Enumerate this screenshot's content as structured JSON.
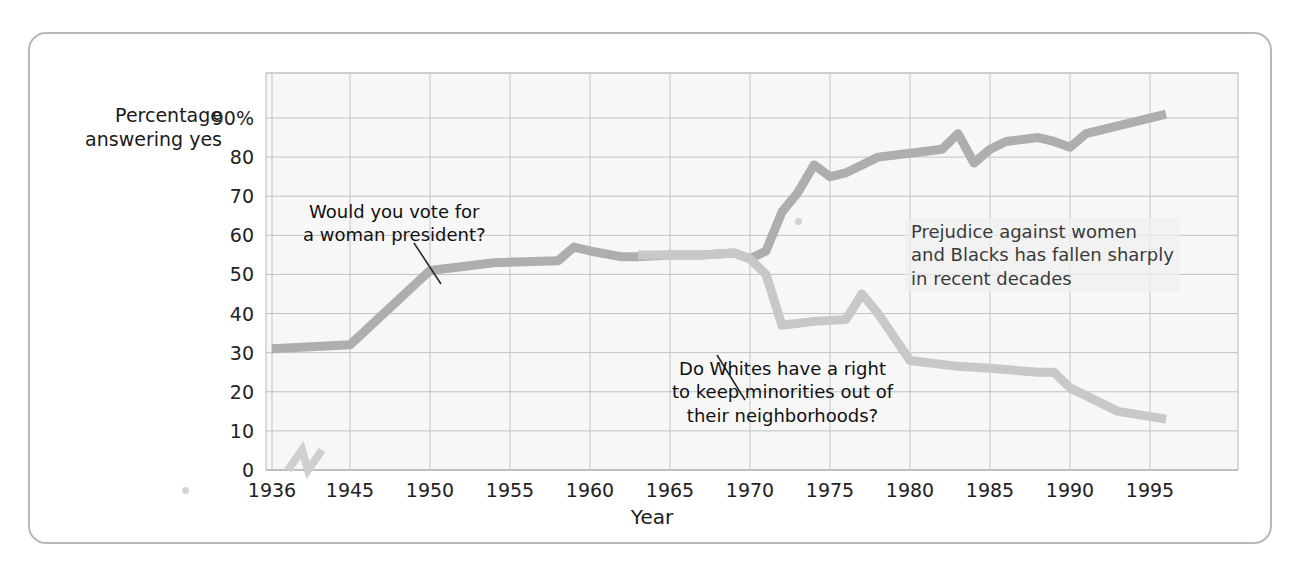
{
  "figure": {
    "y_axis_title_line1": "Percentage",
    "y_axis_title_line2": "answering yes",
    "x_axis_title": "Year",
    "annotation_women_line1": "Would you vote for",
    "annotation_women_line2": "a woman president?",
    "annotation_whites_line1": "Do Whites have a right",
    "annotation_whites_line2": "to keep minorities out of",
    "annotation_whites_line3": "their neighborhoods?",
    "annotation_summary_line1": "Prejudice against women",
    "annotation_summary_line2": "and Blacks has fallen sharply",
    "annotation_summary_line3": "in recent decades",
    "colors": {
      "series_women": "#aeaeae",
      "series_whites": "#c8c8c8",
      "grid": "#bfc3c6",
      "frame": "#b9b9b9",
      "text": "#1b1b1b",
      "plot_bg": "#f7f7f7"
    }
  },
  "chart_data": {
    "type": "line",
    "title": "",
    "xlabel": "Year",
    "ylabel": "Percentage answering yes",
    "xlim": [
      1936,
      1998
    ],
    "ylim": [
      0,
      95
    ],
    "grid": true,
    "axis_break": {
      "after": 1936,
      "before": 1945,
      "note": "x-axis break between 1936 and 1945"
    },
    "xticks": [
      1936,
      1945,
      1950,
      1955,
      1960,
      1965,
      1970,
      1975,
      1980,
      1985,
      1990,
      1995
    ],
    "xtick_labels": [
      "1936",
      "1945",
      "1950",
      "1955",
      "1960",
      "1965",
      "1970",
      "1975",
      "1980",
      "1985",
      "1990",
      "1995"
    ],
    "yticks": [
      0,
      10,
      20,
      30,
      40,
      50,
      60,
      70,
      80,
      90
    ],
    "ytick_labels": [
      "0",
      "10",
      "20",
      "30",
      "40",
      "50",
      "60",
      "70",
      "80",
      "90%"
    ],
    "legend": "none",
    "series": [
      {
        "name": "Would you vote for a woman president?",
        "color": "#aeaeae",
        "points": [
          [
            1936,
            31
          ],
          [
            1945,
            32
          ],
          [
            1950,
            51
          ],
          [
            1954,
            53
          ],
          [
            1958,
            53.5
          ],
          [
            1959,
            57
          ],
          [
            1960,
            56
          ],
          [
            1962,
            54.5
          ],
          [
            1963,
            54.5
          ],
          [
            1965,
            55
          ],
          [
            1967,
            55
          ],
          [
            1969,
            55.5
          ],
          [
            1970,
            54
          ],
          [
            1971,
            56
          ],
          [
            1972,
            66
          ],
          [
            1973,
            71
          ],
          [
            1974,
            78
          ],
          [
            1975,
            75
          ],
          [
            1976,
            76
          ],
          [
            1977,
            78
          ],
          [
            1978,
            80
          ],
          [
            1980,
            81
          ],
          [
            1982,
            82
          ],
          [
            1983,
            86
          ],
          [
            1984,
            78.5
          ],
          [
            1985,
            82
          ],
          [
            1986,
            84
          ],
          [
            1988,
            85
          ],
          [
            1989,
            84
          ],
          [
            1990,
            82.5
          ],
          [
            1991,
            86
          ],
          [
            1993,
            88
          ],
          [
            1996,
            91
          ]
        ]
      },
      {
        "name": "Do Whites have a right to keep minorities out of their neighborhoods?",
        "color": "#c8c8c8",
        "points": [
          [
            1963,
            55
          ],
          [
            1965,
            55
          ],
          [
            1967,
            55
          ],
          [
            1969,
            55.5
          ],
          [
            1970,
            54
          ],
          [
            1971,
            50
          ],
          [
            1972,
            37
          ],
          [
            1974,
            38
          ],
          [
            1976,
            38.5
          ],
          [
            1977,
            45
          ],
          [
            1978,
            40
          ],
          [
            1980,
            28
          ],
          [
            1983,
            26.5
          ],
          [
            1985,
            26
          ],
          [
            1988,
            25
          ],
          [
            1989,
            25
          ],
          [
            1990,
            21
          ],
          [
            1993,
            15
          ],
          [
            1996,
            13
          ]
        ]
      }
    ],
    "annotations": [
      {
        "text": "Would you vote for a woman president?",
        "points_to_series": "women",
        "year": 1948
      },
      {
        "text": "Do Whites have a right to keep minorities out of their neighborhoods?",
        "points_to_series": "whites",
        "year": 1973
      },
      {
        "text": "Prejudice against women and Blacks has fallen sharply in recent decades",
        "points_to_series": "none"
      }
    ]
  }
}
